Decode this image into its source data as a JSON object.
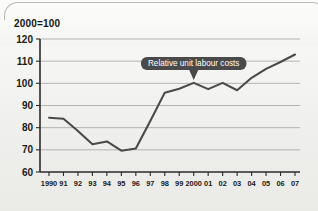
{
  "panel": {
    "unit_label": "2000=100",
    "background_color": "#f2f2f0",
    "frame_color": "#b9b9b6"
  },
  "chart_data": {
    "type": "line",
    "title": "",
    "subtitle": "",
    "unit_note": "2000=100",
    "xlabel": "",
    "ylabel": "",
    "ylim": [
      60,
      120
    ],
    "ytick_step": 10,
    "yticks": [
      60,
      70,
      80,
      90,
      100,
      110,
      120
    ],
    "ytick_labels": [
      "60",
      "70",
      "80",
      "90",
      "100",
      "110",
      "120"
    ],
    "grid": true,
    "grid_axis": "y",
    "legend": false,
    "legend_position": "none",
    "x": [
      1990,
      1991,
      1992,
      1993,
      1994,
      1995,
      1996,
      1997,
      1998,
      1999,
      2000,
      2001,
      2002,
      2003,
      2004,
      2005,
      2006,
      2007
    ],
    "xtick_labels": [
      "1990",
      "91",
      "92",
      "93",
      "94",
      "95",
      "96",
      "97",
      "98",
      "99",
      "2000",
      "01",
      "02",
      "03",
      "04",
      "05",
      "06",
      "07"
    ],
    "series": [
      {
        "name": "Relative unit labour costs",
        "color": "#4a4a4a",
        "values": [
          84.5,
          84.0,
          78.5,
          72.5,
          73.8,
          69.6,
          70.6,
          83.0,
          95.8,
          97.6,
          100.2,
          97.4,
          100.2,
          96.9,
          102.5,
          106.5,
          109.6,
          113.0
        ]
      }
    ],
    "annotations": [
      {
        "text": "Relative unit labour costs",
        "points_to_x": 2000,
        "points_to_y": 100.2,
        "style": "callout-bubble",
        "background_color": "#4a4a4a",
        "text_color": "#ffffff"
      }
    ]
  }
}
